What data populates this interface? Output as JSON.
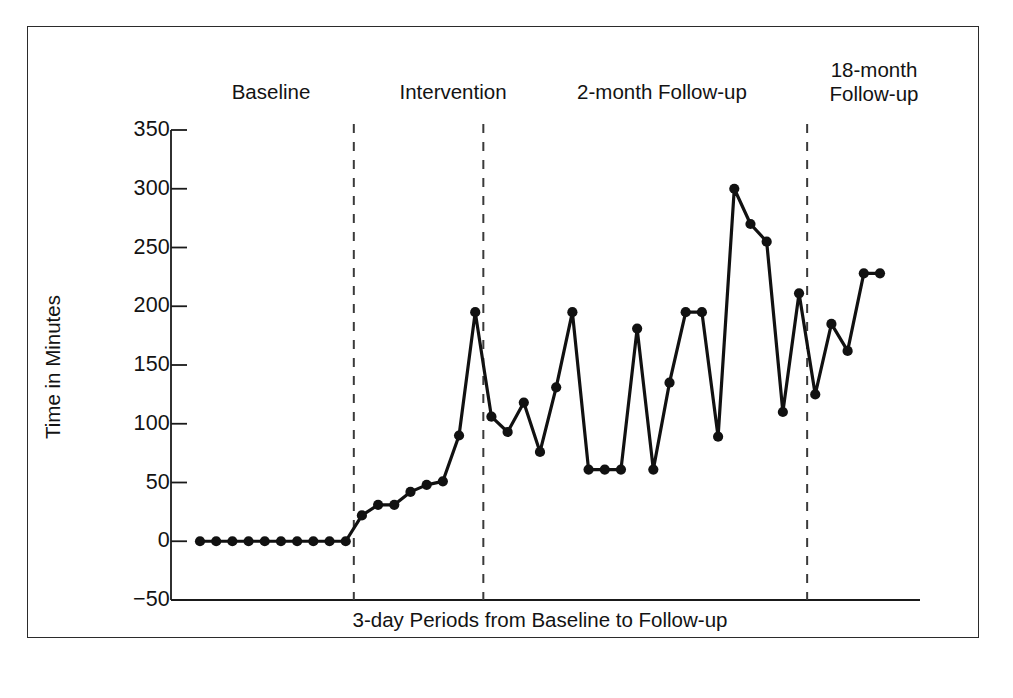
{
  "chart_data": {
    "type": "line",
    "title": "",
    "xlabel": "3-day Periods from Baseline to Follow-up",
    "ylabel": "Time in Minutes",
    "ylim": [
      -50,
      350
    ],
    "yticks": [
      350,
      300,
      250,
      200,
      150,
      100,
      50,
      0,
      -50
    ],
    "ytick_labels": [
      "350",
      "300",
      "250",
      "200",
      "150",
      "100",
      "50",
      "0",
      "−50"
    ],
    "grid": false,
    "legend": null,
    "marker": "filled-circle",
    "line_color": "#111111",
    "marker_color": "#111111",
    "x": [
      1,
      2,
      3,
      4,
      5,
      6,
      7,
      8,
      9,
      10,
      11,
      12,
      13,
      14,
      15,
      16,
      17,
      18,
      19,
      20,
      21,
      22,
      23,
      24,
      25,
      26,
      27,
      28,
      29,
      30,
      31,
      32,
      33,
      34,
      35,
      36,
      37,
      38,
      39,
      40,
      41,
      42,
      43
    ],
    "values": [
      0,
      0,
      0,
      0,
      0,
      0,
      0,
      0,
      0,
      0,
      22,
      31,
      31,
      42,
      48,
      51,
      90,
      195,
      106,
      93,
      118,
      76,
      131,
      195,
      61,
      61,
      61,
      181,
      61,
      135,
      195,
      195,
      89,
      300,
      270,
      255,
      110,
      211,
      125,
      185,
      162,
      228,
      228
    ],
    "phases": [
      {
        "name": "Baseline",
        "label": "Baseline",
        "start_index": 0,
        "end_index": 9
      },
      {
        "name": "Intervention",
        "label": "Intervention",
        "start_index": 10,
        "end_index": 17
      },
      {
        "name": "2-month Follow-up",
        "label": "2-month Follow-up",
        "start_index": 18,
        "end_index": 37
      },
      {
        "name": "18-month Follow-up",
        "label": "18-month\nFollow-up",
        "start_index": 38,
        "end_index": 42
      }
    ],
    "phase_divider_style": "dashed"
  },
  "axis": {
    "y_title": "Time in Minutes",
    "x_title": "3-day Periods from Baseline to Follow-up",
    "y_tick_labels": [
      "350",
      "300",
      "250",
      "200",
      "150",
      "100",
      "50",
      "0",
      "−50"
    ]
  },
  "phase_labels": {
    "baseline": "Baseline",
    "intervention": "Intervention",
    "two_month": "2-month Follow-up",
    "eighteen_month": "18-month\nFollow-up"
  },
  "colors": {
    "line": "#111111",
    "marker": "#111111",
    "axis": "#1a1a1a",
    "divider": "#3a3a3a",
    "frame": "#2b2b2b",
    "background": "#ffffff"
  }
}
